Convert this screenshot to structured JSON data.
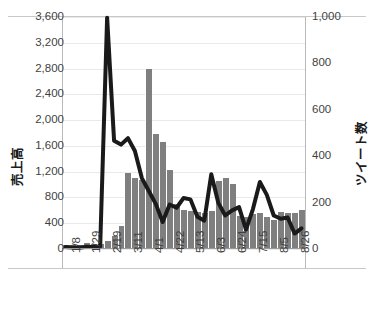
{
  "chart_data": {
    "type": "bar",
    "title": "",
    "subtitle": "",
    "xlabel": "",
    "ylabel": "売上高",
    "y2label": "ツイート数",
    "grid": true,
    "legend": "none",
    "ylim": [
      0,
      3600
    ],
    "ytick_step": 400,
    "y2lim": [
      0,
      1000
    ],
    "y2tick_step": 200,
    "y_ticks": [
      "0",
      "400",
      "800",
      "1,200",
      "1,600",
      "2,000",
      "2,400",
      "2,800",
      "3,200",
      "3,600"
    ],
    "y2_ticks": [
      "0",
      "200",
      "400",
      "600",
      "800",
      "1,000"
    ],
    "x_tick_labels": [
      "1/8",
      "1/29",
      "2/19",
      "3/11",
      "4/1",
      "4/22",
      "5/13",
      "6/3",
      "6/24",
      "7/15",
      "8/5",
      "8/26"
    ],
    "x_tick_indices": [
      0,
      3,
      6,
      9,
      12,
      15,
      18,
      21,
      24,
      27,
      30,
      33
    ],
    "categories": [
      "1/8",
      "1/15",
      "1/22",
      "1/29",
      "2/5",
      "2/12",
      "2/19",
      "2/26",
      "3/4",
      "3/11",
      "3/18",
      "3/25",
      "4/1",
      "4/8",
      "4/15",
      "4/22",
      "4/29",
      "5/6",
      "5/13",
      "5/20",
      "5/27",
      "6/3",
      "6/10",
      "6/17",
      "6/24",
      "7/1",
      "7/8",
      "7/15",
      "7/22",
      "7/29",
      "8/5",
      "8/12",
      "8/19",
      "8/26",
      "9/2"
    ],
    "series": [
      {
        "name": "ツイート数",
        "type": "bar",
        "axis": "right",
        "color": "#7f7f7f",
        "values": [
          15,
          13,
          14,
          22,
          16,
          18,
          30,
          50,
          95,
          325,
          300,
          295,
          770,
          490,
          455,
          335,
          190,
          165,
          160,
          155,
          150,
          160,
          290,
          300,
          275,
          140,
          135,
          145,
          150,
          135,
          120,
          155,
          152,
          150,
          162
        ]
      },
      {
        "name": "売上高",
        "type": "line",
        "axis": "left",
        "color": "#1a1a1a",
        "values": [
          30,
          25,
          20,
          35,
          30,
          40,
          3590,
          1680,
          1620,
          1720,
          1520,
          1100,
          900,
          700,
          420,
          690,
          640,
          790,
          770,
          500,
          440,
          1160,
          720,
          520,
          600,
          650,
          300,
          620,
          1040,
          840,
          520,
          470,
          490,
          240,
          320
        ]
      }
    ]
  }
}
